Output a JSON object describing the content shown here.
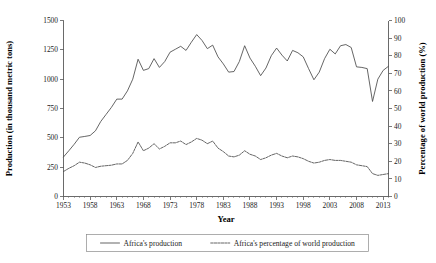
{
  "chart_data": {
    "type": "line",
    "title": "",
    "xlabel": "Year",
    "ylabel": "Production (in thousand metric tons)",
    "y2label": "Percentage of world production (%)",
    "xlim": [
      1953,
      2014
    ],
    "ylim": [
      0,
      1500
    ],
    "y2lim": [
      0,
      100
    ],
    "xticks": [
      1953,
      1958,
      1963,
      1968,
      1973,
      1978,
      1983,
      1988,
      1993,
      1998,
      2003,
      2008,
      2013
    ],
    "yticks": [
      0,
      250,
      500,
      750,
      1000,
      1250,
      1500
    ],
    "y2ticks": [
      0,
      10,
      20,
      30,
      40,
      50,
      60,
      70,
      80,
      90,
      100
    ],
    "grid": false,
    "legend_position": "bottom",
    "x": [
      1953,
      1954,
      1955,
      1956,
      1957,
      1958,
      1959,
      1960,
      1961,
      1962,
      1963,
      1964,
      1965,
      1966,
      1967,
      1968,
      1969,
      1970,
      1971,
      1972,
      1973,
      1974,
      1975,
      1976,
      1977,
      1978,
      1979,
      1980,
      1981,
      1982,
      1983,
      1984,
      1985,
      1986,
      1987,
      1988,
      1989,
      1990,
      1991,
      1992,
      1993,
      1994,
      1995,
      1996,
      1997,
      1998,
      1999,
      2000,
      2001,
      2002,
      2003,
      2004,
      2005,
      2006,
      2007,
      2008,
      2009,
      2010,
      2011,
      2012,
      2013,
      2014
    ],
    "series": [
      {
        "name": "Africa's production",
        "axis": "left",
        "style": "solid",
        "unit": "thousand metric tons",
        "values": [
          337,
          390,
          445,
          505,
          512,
          520,
          560,
          640,
          700,
          760,
          830,
          830,
          900,
          1000,
          1170,
          1075,
          1090,
          1175,
          1100,
          1150,
          1230,
          1255,
          1280,
          1245,
          1315,
          1380,
          1330,
          1260,
          1290,
          1190,
          1130,
          1060,
          1065,
          1150,
          1285,
          1180,
          1110,
          1030,
          1095,
          1200,
          1265,
          1205,
          1155,
          1245,
          1225,
          1190,
          1090,
          995,
          1060,
          1175,
          1255,
          1215,
          1285,
          1295,
          1270,
          1105,
          1100,
          1090,
          810,
          1000,
          1075,
          1110
        ]
      },
      {
        "name": "Africa's percentage of world production",
        "axis": "right",
        "style": "dashed",
        "unit": "%",
        "values": [
          14.2,
          16.0,
          17.5,
          19.5,
          19.0,
          18.0,
          16.5,
          17.2,
          17.5,
          17.8,
          18.5,
          18.5,
          20.5,
          24.5,
          31.0,
          26.0,
          27.5,
          30.0,
          27.0,
          28.5,
          30.5,
          30.5,
          31.5,
          29.5,
          31.0,
          33.0,
          32.0,
          30.0,
          31.5,
          27.5,
          25.5,
          23.0,
          22.5,
          23.5,
          26.0,
          24.0,
          23.0,
          21.0,
          22.0,
          23.5,
          24.5,
          23.0,
          22.0,
          23.0,
          22.5,
          21.5,
          20.0,
          19.0,
          19.5,
          20.5,
          21.0,
          20.5,
          20.5,
          20.0,
          19.5,
          18.0,
          17.5,
          17.0,
          13.0,
          12.0,
          12.5,
          13.0
        ]
      }
    ],
    "series_right_extra": {
      "note": "",
      "values": [
        21.5,
        21.0,
        20.0,
        19.5,
        19.0,
        19.0,
        19.5,
        20.0,
        20.5,
        20.5,
        20.5,
        20.0,
        19.5,
        18.0,
        17.0,
        16.5,
        13.0,
        12.5,
        12.5,
        13.0,
        12.5,
        12.0,
        11.5,
        11.8,
        12.5
      ]
    }
  },
  "legend": {
    "items": [
      {
        "label": "Africa's production",
        "style": "solid"
      },
      {
        "label": "Africa's percentage of world production",
        "style": "dashed"
      }
    ]
  },
  "axes": {
    "x_title": "Year",
    "y_left_title": "Production (in thousand metric tons)",
    "y_right_title": "Percentage of world production (%)"
  }
}
